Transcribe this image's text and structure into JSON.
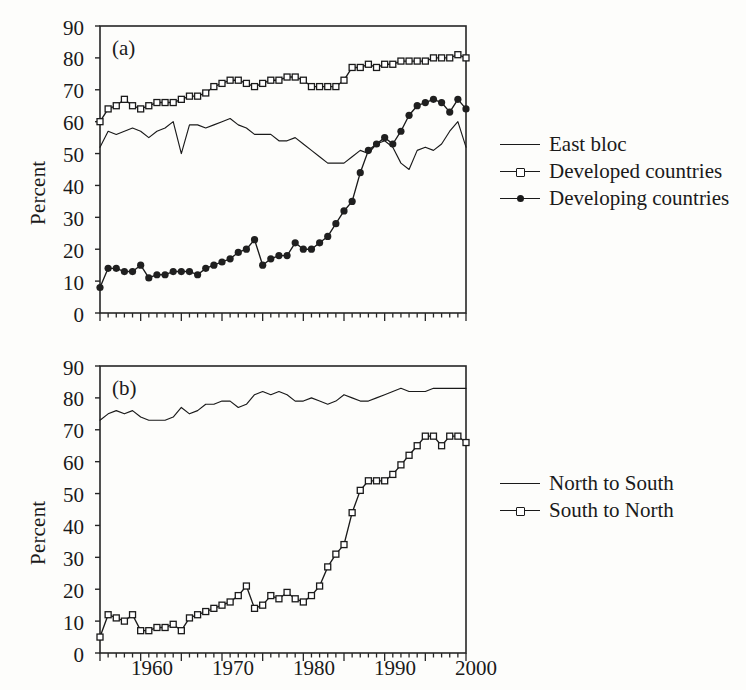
{
  "figure": {
    "panels": [
      {
        "tag": "(a)",
        "ylabel": "Percent"
      },
      {
        "tag": "(b)",
        "ylabel": "Percent"
      }
    ],
    "yticks": [
      "0",
      "10",
      "20",
      "30",
      "40",
      "50",
      "60",
      "70",
      "80",
      "90"
    ],
    "xticks": [
      "1960",
      "1970",
      "1980",
      "1990",
      "2000"
    ],
    "legend_a": [
      {
        "label": "East bloc",
        "marker": "none",
        "symbol_name": "line-swatch"
      },
      {
        "label": "Developed countries",
        "marker": "open",
        "symbol_name": "open-square-swatch"
      },
      {
        "label": "Developing countries",
        "marker": "filled",
        "symbol_name": "filled-circle-swatch"
      }
    ],
    "legend_b": [
      {
        "label": "North to South",
        "marker": "none",
        "symbol_name": "line-swatch"
      },
      {
        "label": "South to North",
        "marker": "open",
        "symbol_name": "open-square-swatch"
      }
    ]
  },
  "chart_data": [
    {
      "type": "line",
      "panel": "(a)",
      "title": "",
      "xlabel": "",
      "ylabel": "Percent",
      "xlim": [
        1955,
        2000
      ],
      "ylim": [
        0,
        90
      ],
      "grid": false,
      "legend_position": "right",
      "x": [
        1955,
        1956,
        1957,
        1958,
        1959,
        1960,
        1961,
        1962,
        1963,
        1964,
        1965,
        1966,
        1967,
        1968,
        1969,
        1970,
        1971,
        1972,
        1973,
        1974,
        1975,
        1976,
        1977,
        1978,
        1979,
        1980,
        1981,
        1982,
        1983,
        1984,
        1985,
        1986,
        1987,
        1988,
        1989,
        1990,
        1991,
        1992,
        1993,
        1994,
        1995,
        1996,
        1997,
        1998,
        1999,
        2000
      ],
      "series": [
        {
          "name": "East bloc",
          "marker": "none",
          "values": [
            52,
            57,
            56,
            57,
            58,
            57,
            55,
            57,
            58,
            60,
            50,
            59,
            59,
            58,
            59,
            60,
            61,
            59,
            58,
            56,
            56,
            56,
            54,
            54,
            55,
            53,
            51,
            49,
            47,
            47,
            47,
            49,
            51,
            50,
            53,
            54,
            52,
            47,
            45,
            51,
            52,
            51,
            53,
            57,
            60,
            52
          ]
        },
        {
          "name": "Developed countries",
          "marker": "open",
          "values": [
            60,
            64,
            65,
            67,
            65,
            64,
            65,
            66,
            66,
            66,
            67,
            68,
            68,
            69,
            71,
            72,
            73,
            73,
            72,
            71,
            72,
            73,
            73,
            74,
            74,
            73,
            71,
            71,
            71,
            71,
            73,
            77,
            77,
            78,
            77,
            78,
            78,
            79,
            79,
            79,
            79,
            80,
            80,
            80,
            81,
            80
          ]
        },
        {
          "name": "Developing countries",
          "marker": "filled",
          "values": [
            8,
            14,
            14,
            13,
            13,
            15,
            11,
            12,
            12,
            13,
            13,
            13,
            12,
            14,
            15,
            16,
            17,
            19,
            20,
            23,
            15,
            17,
            18,
            18,
            22,
            20,
            20,
            22,
            24,
            28,
            32,
            35,
            44,
            51,
            53,
            55,
            53,
            57,
            62,
            65,
            66,
            67,
            66,
            63,
            67,
            64
          ]
        }
      ]
    },
    {
      "type": "line",
      "panel": "(b)",
      "title": "",
      "xlabel": "",
      "ylabel": "Percent",
      "xlim": [
        1955,
        2000
      ],
      "ylim": [
        0,
        90
      ],
      "grid": false,
      "legend_position": "right",
      "x": [
        1955,
        1956,
        1957,
        1958,
        1959,
        1960,
        1961,
        1962,
        1963,
        1964,
        1965,
        1966,
        1967,
        1968,
        1969,
        1970,
        1971,
        1972,
        1973,
        1974,
        1975,
        1976,
        1977,
        1978,
        1979,
        1980,
        1981,
        1982,
        1983,
        1984,
        1985,
        1986,
        1987,
        1988,
        1989,
        1990,
        1991,
        1992,
        1993,
        1994,
        1995,
        1996,
        1997,
        1998,
        1999,
        2000
      ],
      "series": [
        {
          "name": "North to South",
          "marker": "none",
          "values": [
            73,
            75,
            76,
            75,
            76,
            74,
            73,
            73,
            73,
            74,
            77,
            75,
            76,
            78,
            78,
            79,
            79,
            77,
            78,
            81,
            82,
            81,
            82,
            81,
            79,
            79,
            80,
            79,
            78,
            79,
            81,
            80,
            79,
            79,
            80,
            81,
            82,
            83,
            82,
            82,
            82,
            83,
            83,
            83,
            83,
            83
          ]
        },
        {
          "name": "South to North",
          "marker": "open",
          "values": [
            5,
            12,
            11,
            10,
            12,
            7,
            7,
            8,
            8,
            9,
            7,
            11,
            12,
            13,
            14,
            15,
            16,
            18,
            21,
            14,
            15,
            18,
            17,
            19,
            17,
            16,
            18,
            21,
            27,
            31,
            34,
            44,
            51,
            54,
            54,
            54,
            56,
            59,
            62,
            65,
            68,
            68,
            65,
            68,
            68,
            66
          ]
        }
      ]
    }
  ]
}
